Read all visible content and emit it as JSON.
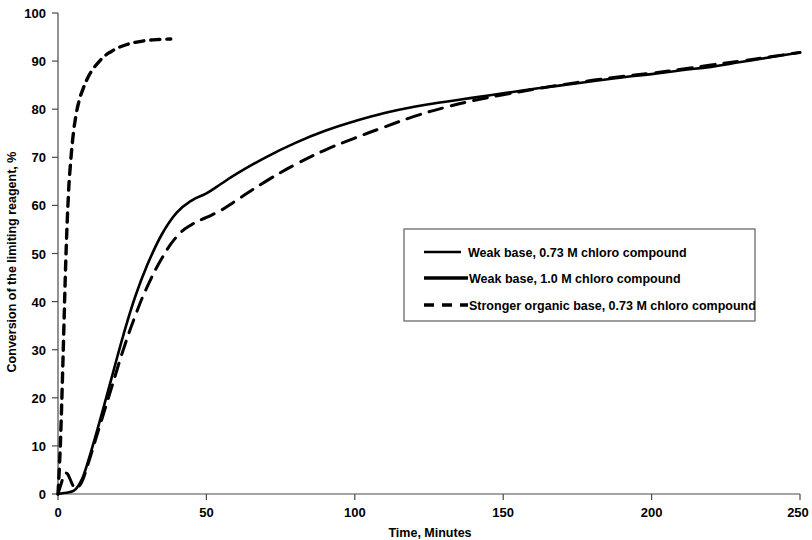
{
  "chart_data": {
    "type": "line",
    "title": "",
    "xlabel": "Time, Minutes",
    "ylabel": "Conversion of the limiting reagent, %",
    "xlim": [
      0,
      250
    ],
    "ylim": [
      0,
      100
    ],
    "xticks": [
      0,
      50,
      100,
      150,
      200,
      250
    ],
    "yticks": [
      0,
      10,
      20,
      30,
      40,
      50,
      60,
      70,
      80,
      90,
      100
    ],
    "xtick_labels": [
      "0",
      "50",
      "100",
      "150",
      "200",
      "250"
    ],
    "ytick_labels": [
      "0",
      "10",
      "20",
      "30",
      "40",
      "50",
      "60",
      "70",
      "80",
      "90",
      "100"
    ],
    "grid": false,
    "legend_position": "center-right",
    "series": [
      {
        "name": "Weak base, 0.73 M chloro compound",
        "style": "solid",
        "color": "#000000",
        "x": [
          0,
          2,
          4,
          6,
          8,
          10,
          14,
          18,
          22,
          26,
          30,
          35,
          40,
          45,
          50,
          55,
          60,
          70,
          80,
          90,
          100,
          110,
          120,
          130,
          140,
          150,
          160,
          170,
          180,
          190,
          200,
          210,
          220,
          230,
          240,
          250
        ],
        "y": [
          0,
          0.2,
          0.4,
          1.0,
          3.0,
          6.5,
          15.0,
          24.0,
          33.0,
          41.0,
          47.5,
          54.0,
          58.5,
          61.0,
          62.5,
          64.5,
          66.5,
          70.0,
          73.0,
          75.5,
          77.5,
          79.2,
          80.5,
          81.5,
          82.4,
          83.3,
          84.2,
          85.0,
          85.8,
          86.6,
          87.3,
          88.1,
          88.8,
          89.8,
          90.8,
          91.8
        ]
      },
      {
        "name": "Weak base, 1.0 M chloro compound",
        "style": "solid",
        "color": "#000000",
        "x": [
          0,
          1,
          2,
          3,
          4,
          5,
          6,
          8,
          10,
          14,
          18,
          22,
          26,
          30,
          35,
          40,
          45,
          50,
          55,
          60,
          70,
          80,
          90,
          100,
          110,
          120,
          130,
          140,
          150,
          160,
          170,
          180,
          190,
          200,
          210,
          220,
          230,
          240,
          250
        ],
        "y": [
          0,
          2.0,
          3.8,
          4.3,
          3.2,
          1.8,
          1.2,
          2.5,
          6.0,
          14.0,
          22.0,
          30.0,
          37.0,
          43.0,
          49.0,
          53.5,
          56.0,
          57.5,
          59.0,
          61.0,
          65.0,
          68.5,
          71.5,
          74.0,
          76.3,
          78.5,
          80.3,
          81.8,
          83.0,
          84.1,
          85.1,
          86.0,
          86.8,
          87.5,
          88.3,
          89.2,
          90.0,
          90.9,
          91.8
        ]
      },
      {
        "name": "Stronger organic base, 0.73 M chloro compound",
        "style": "dashed",
        "color": "#000000",
        "x": [
          0,
          0.5,
          1,
          1.5,
          2,
          2.5,
          3,
          3.5,
          4,
          5,
          6,
          7,
          8,
          10,
          12,
          14,
          16,
          18,
          20,
          23,
          26,
          30,
          34,
          38
        ],
        "y": [
          0,
          6,
          14,
          24,
          35,
          46,
          55,
          62,
          67,
          74,
          78.5,
          81.5,
          83.5,
          86.5,
          88.5,
          90.0,
          91.2,
          92.0,
          92.7,
          93.4,
          93.9,
          94.3,
          94.5,
          94.6
        ]
      }
    ],
    "legend": [
      {
        "label": "Weak base, 0.73 M chloro compound",
        "style": "solid",
        "thin": true
      },
      {
        "label": "Weak base, 1.0 M chloro compound",
        "style": "solid",
        "thin": false
      },
      {
        "label": "Stronger organic base, 0.73 M chloro compound",
        "style": "dashed",
        "thin": false
      }
    ]
  }
}
